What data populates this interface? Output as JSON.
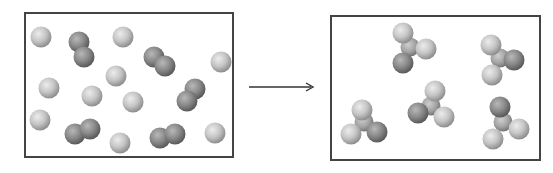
{
  "diagram": {
    "title": "",
    "colors": {
      "background": "#ffffff",
      "border": "#444444",
      "light_atom": "#c8c8c8",
      "dark_atom": "#8a8a8a",
      "arrow": "#333333"
    },
    "reactants_panel": {
      "box": {
        "x": 24,
        "y": 12,
        "w": 210,
        "h": 146
      },
      "atom_radius": 10.5,
      "single_light_atoms": [
        [
          41,
          37
        ],
        [
          123,
          37
        ],
        [
          221,
          62
        ],
        [
          49,
          88
        ],
        [
          92,
          96
        ],
        [
          116,
          76
        ],
        [
          133,
          102
        ],
        [
          40,
          120
        ],
        [
          120,
          143
        ],
        [
          215,
          133
        ]
      ],
      "dark_diatomic_molecules": [
        [
          [
            79,
            42
          ],
          [
            84,
            57
          ]
        ],
        [
          [
            154,
            57
          ],
          [
            165,
            66
          ]
        ],
        [
          [
            195,
            89
          ],
          [
            187,
            101
          ]
        ],
        [
          [
            75,
            134
          ],
          [
            90,
            129
          ]
        ],
        [
          [
            160,
            138
          ],
          [
            175,
            134
          ]
        ]
      ]
    },
    "arrow": {
      "x1": 249,
      "y1": 87,
      "x2": 313,
      "y2": 87,
      "label": ""
    },
    "products_panel": {
      "box": {
        "x": 330,
        "y": 15,
        "w": 211,
        "h": 146
      },
      "atom_radius": 10.5,
      "molecules": [
        {
          "center": [
            410,
            47
          ],
          "atoms": [
            {
              "p": [
                403,
                33
              ],
              "t": "light"
            },
            {
              "p": [
                426,
                49
              ],
              "t": "light"
            },
            {
              "p": [
                403,
                63
              ],
              "t": "dark"
            }
          ]
        },
        {
          "center": [
            500,
            58
          ],
          "atoms": [
            {
              "p": [
                491,
                45
              ],
              "t": "light"
            },
            {
              "p": [
                514,
                60
              ],
              "t": "dark"
            },
            {
              "p": [
                492,
                75
              ],
              "t": "light"
            }
          ]
        },
        {
          "center": [
            431,
            106
          ],
          "atoms": [
            {
              "p": [
                435,
                91
              ],
              "t": "light"
            },
            {
              "p": [
                418,
                113
              ],
              "t": "dark"
            },
            {
              "p": [
                444,
                117
              ],
              "t": "light"
            }
          ]
        },
        {
          "center": [
            364,
            122
          ],
          "atoms": [
            {
              "p": [
                362,
                110
              ],
              "t": "light"
            },
            {
              "p": [
                351,
                134
              ],
              "t": "light"
            },
            {
              "p": [
                377,
                132
              ],
              "t": "dark"
            }
          ]
        },
        {
          "center": [
            503,
            122
          ],
          "atoms": [
            {
              "p": [
                500,
                107
              ],
              "t": "dark"
            },
            {
              "p": [
                519,
                129
              ],
              "t": "light"
            },
            {
              "p": [
                493,
                139
              ],
              "t": "light"
            }
          ]
        }
      ]
    }
  }
}
